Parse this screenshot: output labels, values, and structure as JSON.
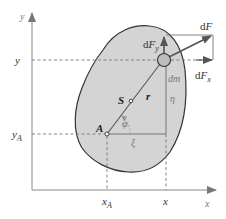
{
  "diagram": {
    "axes": {
      "x_axis_label": "x",
      "y_axis_label": "y"
    },
    "tick_labels": {
      "x_A": {
        "base": "x",
        "sub": "A"
      },
      "x": "x",
      "y": "y",
      "y_A": {
        "base": "y",
        "sub": "A"
      }
    },
    "points": {
      "A": "A",
      "S": "S",
      "dm": "dm"
    },
    "vectors": {
      "r": "r",
      "dF": {
        "d": "d",
        "F": "F"
      },
      "dF_x": {
        "d": "d",
        "F": "F",
        "sub": "x"
      },
      "dF_y": {
        "d": "d",
        "F": "F",
        "sub": "y"
      }
    },
    "quantities": {
      "phi": "φ",
      "xi": "ξ",
      "eta": "η"
    },
    "colors": {
      "body_fill": "#d4d4d4",
      "body_outline": "#333333",
      "axis": "#888888",
      "dashed": "#777777",
      "vector": "#555555",
      "mass_point_fill": "#bdbdbd"
    }
  }
}
